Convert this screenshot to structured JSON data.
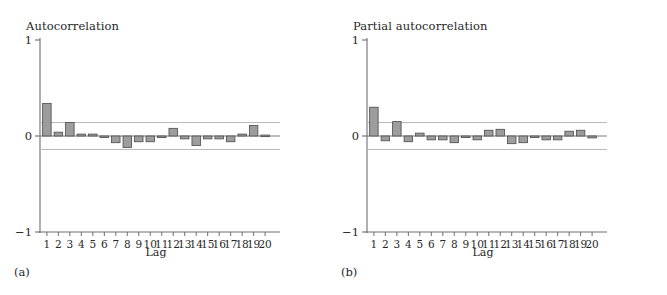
{
  "figure": {
    "background": "#ffffff",
    "bar_fill": "#9d9d9d",
    "bar_stroke": "#4a4a4a",
    "axis_color": "#6e6e6e",
    "band_color": "#b8b8b8",
    "text_color": "#262626"
  },
  "panels": [
    {
      "tag": "(a)",
      "chart_data": {
        "type": "bar",
        "title": "Autocorrelation",
        "xlabel": "Lag",
        "ylabel": "",
        "ylim": [
          -1,
          1
        ],
        "yticks": [
          1,
          0,
          -1
        ],
        "ytick_labels": [
          "1",
          "0",
          "−1"
        ],
        "xlim": [
          0.4,
          20.6
        ],
        "grid": false,
        "legend": "none",
        "categories": [
          1,
          2,
          3,
          4,
          5,
          6,
          7,
          8,
          9,
          10,
          11,
          12,
          13,
          14,
          15,
          16,
          17,
          18,
          19,
          20
        ],
        "values": [
          0.34,
          0.04,
          0.14,
          0.02,
          0.02,
          -0.01,
          -0.07,
          -0.12,
          -0.06,
          -0.06,
          -0.01,
          0.08,
          -0.03,
          -0.1,
          -0.03,
          -0.03,
          -0.06,
          0.02,
          0.11,
          0.01
        ],
        "confidence_band": [
          -0.14,
          0.14
        ],
        "annotations": [
          "95% confidence bands drawn at ±0.14"
        ]
      }
    },
    {
      "tag": "(b)",
      "chart_data": {
        "type": "bar",
        "title": "Partial autocorrelation",
        "xlabel": "Lag",
        "ylabel": "",
        "ylim": [
          -1,
          1
        ],
        "yticks": [
          1,
          0,
          -1
        ],
        "ytick_labels": [
          "1",
          "0",
          "−1"
        ],
        "xlim": [
          0.4,
          20.6
        ],
        "grid": false,
        "legend": "none",
        "categories": [
          1,
          2,
          3,
          4,
          5,
          6,
          7,
          8,
          9,
          10,
          11,
          12,
          13,
          14,
          15,
          16,
          17,
          18,
          19,
          20
        ],
        "values": [
          0.3,
          -0.05,
          0.15,
          -0.06,
          0.03,
          -0.04,
          -0.04,
          -0.07,
          0.0,
          -0.04,
          0.06,
          0.07,
          -0.08,
          -0.07,
          -0.01,
          -0.04,
          -0.04,
          0.05,
          0.06,
          -0.02
        ],
        "confidence_band": [
          -0.14,
          0.14
        ],
        "annotations": [
          "95% confidence bands drawn at ±0.14"
        ]
      }
    }
  ]
}
